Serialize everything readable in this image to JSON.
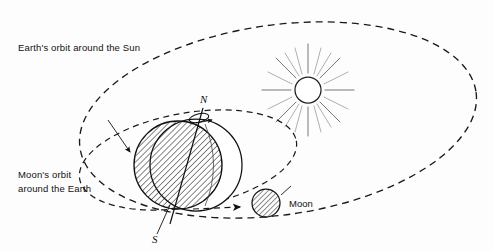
{
  "diagram": {
    "title_implicit": "Earth and Moon orbits relative to the Sun",
    "background_color": "#fdfdfd",
    "ink_color": "#111111",
    "labels": {
      "earth_orbit": "Earth's orbit around the Sun",
      "moon_orbit_line1": "Moon's orbit",
      "moon_orbit_line2": "around the Earth",
      "north_pole": "N",
      "south_pole": "S",
      "moon": "Moon"
    },
    "elements": {
      "sun": {
        "name": "sun",
        "center_x": 308,
        "center_y": 90,
        "radius": 13,
        "ray_count": 16,
        "ray_inner": 17,
        "ray_outer_long": 46,
        "ray_outer_short": 31
      },
      "earth": {
        "name": "earth",
        "center_x": 178,
        "center_y": 165,
        "radius": 44,
        "hatched": true,
        "hatch_angle_deg": 45,
        "lit_outline_center_x": 195,
        "lit_outline_radius": 47,
        "axis_tilt_deg": 23
      },
      "moon": {
        "name": "moon",
        "center_x": 266,
        "center_y": 203,
        "radius": 14,
        "hatched": true
      },
      "earth_orbit_ellipse": {
        "center_x": 278,
        "center_y": 120,
        "rx": 200,
        "ry": 95,
        "rotation_deg": -8,
        "style": "dashed"
      },
      "moon_orbit_ellipse": {
        "center_x": 188,
        "center_y": 160,
        "rx": 110,
        "ry": 47,
        "rotation_deg": -10,
        "style": "dashed"
      },
      "direction_arrow_moon": {
        "name": "earth-to-moon-direction-arrow",
        "from_x": 195,
        "from_y": 208,
        "to_x": 243,
        "to_y": 206
      },
      "direction_arrow_orbit": {
        "name": "moon-orbit-direction-arrow",
        "from_x": 108,
        "from_y": 122,
        "to_x": 132,
        "to_y": 155
      },
      "rotation_arrow": {
        "name": "earth-rotation-arrow",
        "description": "small loop with arrowhead around polar axis"
      }
    }
  }
}
